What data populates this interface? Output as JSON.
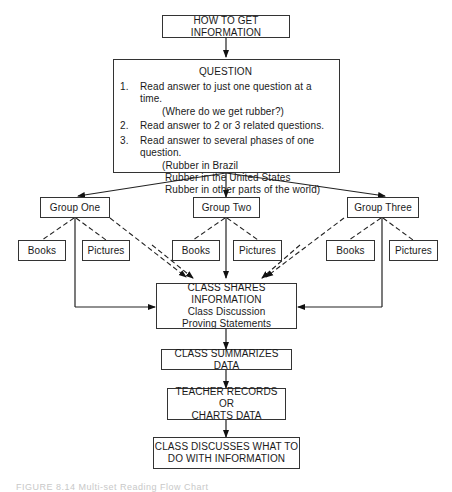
{
  "diagram": {
    "title_box": "HOW TO GET INFORMATION",
    "question_box": {
      "title": "QUESTION",
      "items": [
        {
          "num": "1.",
          "text": "Read answer to just one question at a time.",
          "sub": [
            "(Where do we get rubber?)"
          ]
        },
        {
          "num": "2.",
          "text": "Read answer to 2 or 3 related questions.",
          "sub": []
        },
        {
          "num": "3.",
          "text": "Read answer to several phases of one question.",
          "sub": [
            "(Rubber in Brazil",
            "Rubber in the United States",
            "Rubber in other parts of the world)"
          ]
        }
      ]
    },
    "groups": [
      {
        "label": "Group One",
        "books": "Books",
        "pictures": "Pictures"
      },
      {
        "label": "Group Two",
        "books": "Books",
        "pictures": "Pictures"
      },
      {
        "label": "Group Three",
        "books": "Books",
        "pictures": "Pictures"
      }
    ],
    "share_box": {
      "title": "CLASS SHARES INFORMATION",
      "line1": "Class Discussion",
      "line2": "Proving Statements"
    },
    "summarize_box": "CLASS SUMMARIZES DATA",
    "teacher_box": {
      "line1": "TEACHER RECORDS OR",
      "line2": "CHARTS DATA"
    },
    "discuss_box": {
      "line1": "CLASS DISCUSSES WHAT TO",
      "line2": "DO WITH INFORMATION"
    },
    "caption": "FIGURE 8.14 Multi-set Reading Flow Chart"
  }
}
